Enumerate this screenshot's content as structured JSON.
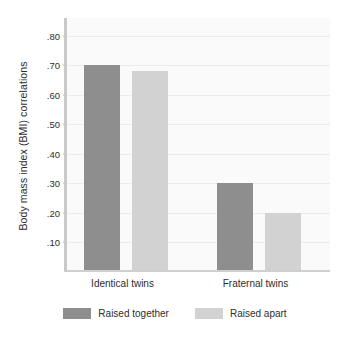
{
  "chart_data": {
    "type": "bar",
    "title": "",
    "xlabel": "",
    "ylabel": "Body mass index (BMI) correlations",
    "categories": [
      "Identical twins",
      "Fraternal twins"
    ],
    "series": [
      {
        "name": "Raised together",
        "color": "#8e8e8e",
        "values": [
          0.7,
          0.3
        ]
      },
      {
        "name": "Raised apart",
        "color": "#d2d2d2",
        "values": [
          0.68,
          0.2
        ]
      }
    ],
    "ylim": [
      0.0,
      0.86
    ],
    "ytick_values": [
      0.8,
      0.7,
      0.6,
      0.5,
      0.4,
      0.3,
      0.2,
      0.1
    ],
    "ytick_labels": [
      ".80",
      ".70",
      ".60",
      ".50",
      ".40",
      ".30",
      ".20",
      ".10"
    ],
    "grid": true,
    "legend_position": "bottom",
    "plot_background": "#fafafa",
    "gridline_color": "#ececec"
  }
}
